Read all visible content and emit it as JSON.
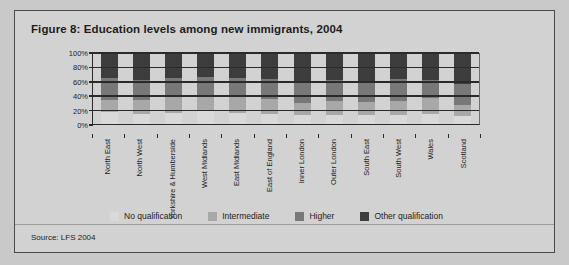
{
  "figure": {
    "title": "Figure 8: Education levels among new immigrants, 2004",
    "source": "Source: LFS 2004"
  },
  "chart_data": {
    "type": "bar",
    "subtype": "100% stacked column",
    "title": "Figure 8: Education levels among new immigrants, 2004",
    "xlabel": "",
    "ylabel": "",
    "ylim": [
      0,
      100
    ],
    "yticks": [
      0,
      20,
      40,
      60,
      80,
      100
    ],
    "ytick_labels": [
      "0%",
      "20%",
      "40%",
      "60%",
      "80%",
      "100%"
    ],
    "grid": true,
    "legend_position": "bottom",
    "categories": [
      "North East",
      "North West",
      "Yorkshire & Humberside",
      "West Midlands",
      "East Midlands",
      "East of England",
      "Inner London",
      "Outer London",
      "South East",
      "South West",
      "Wales",
      "Scotland"
    ],
    "series": [
      {
        "name": "No qualification",
        "color": "#d9d9d9",
        "values": [
          17,
          14,
          16,
          18,
          15,
          14,
          12,
          13,
          12,
          13,
          14,
          11
        ]
      },
      {
        "name": "Intermediate",
        "color": "#a8a8a8",
        "values": [
          17,
          20,
          22,
          23,
          23,
          21,
          18,
          20,
          19,
          20,
          22,
          16
        ]
      },
      {
        "name": "Higher",
        "color": "#787878",
        "values": [
          31,
          28,
          27,
          25,
          27,
          28,
          30,
          29,
          28,
          30,
          26,
          30
        ]
      },
      {
        "name": "Other qualification",
        "color": "#3d3d3d",
        "values": [
          35,
          38,
          35,
          34,
          35,
          37,
          40,
          38,
          41,
          37,
          38,
          43
        ]
      }
    ]
  },
  "legend": {
    "items": [
      {
        "label": "No qualification",
        "color": "#d9d9d9"
      },
      {
        "label": "Intermediate",
        "color": "#a8a8a8"
      },
      {
        "label": "Higher",
        "color": "#787878"
      },
      {
        "label": "Other qualification",
        "color": "#3d3d3d"
      }
    ]
  }
}
